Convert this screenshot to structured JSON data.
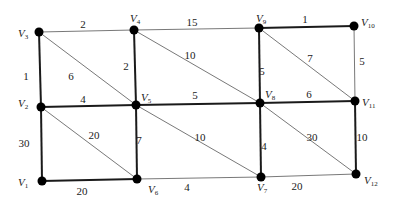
{
  "graph": {
    "nodes": [
      {
        "id": "V1",
        "label": "V",
        "sub": "1",
        "x": 42,
        "y": 181,
        "lx": 18,
        "ly": 186
      },
      {
        "id": "V2",
        "label": "V",
        "sub": "2",
        "x": 41,
        "y": 107,
        "lx": 18,
        "ly": 107
      },
      {
        "id": "V3",
        "label": "V",
        "sub": "3",
        "x": 39,
        "y": 32,
        "lx": 18,
        "ly": 37
      },
      {
        "id": "V4",
        "label": "V",
        "sub": "4",
        "x": 134,
        "y": 30,
        "lx": 130,
        "ly": 22
      },
      {
        "id": "V5",
        "label": "V",
        "sub": "5",
        "x": 136,
        "y": 105,
        "lx": 141,
        "ly": 101
      },
      {
        "id": "V6",
        "label": "V",
        "sub": "6",
        "x": 137,
        "y": 179,
        "lx": 148,
        "ly": 193
      },
      {
        "id": "V7",
        "label": "V",
        "sub": "7",
        "x": 261,
        "y": 177,
        "lx": 257,
        "ly": 191
      },
      {
        "id": "V8",
        "label": "V",
        "sub": "8",
        "x": 260,
        "y": 103,
        "lx": 265,
        "ly": 98
      },
      {
        "id": "V9",
        "label": "V",
        "sub": "9",
        "x": 259,
        "y": 28,
        "lx": 256,
        "ly": 22
      },
      {
        "id": "V10",
        "label": "V",
        "sub": "10",
        "x": 354,
        "y": 26,
        "lx": 361,
        "ly": 26
      },
      {
        "id": "V11",
        "label": "V",
        "sub": "11",
        "x": 355,
        "y": 101,
        "lx": 362,
        "ly": 106
      },
      {
        "id": "V12",
        "label": "V",
        "sub": "12",
        "x": 356,
        "y": 174,
        "lx": 364,
        "ly": 184
      }
    ],
    "edges": [
      {
        "from": "V3",
        "to": "V4",
        "weight": "2",
        "bold": false,
        "lx": 83,
        "ly": 28
      },
      {
        "from": "V4",
        "to": "V9",
        "weight": "15",
        "bold": false,
        "lx": 192,
        "ly": 26
      },
      {
        "from": "V9",
        "to": "V10",
        "weight": "1",
        "bold": true,
        "lx": 305,
        "ly": 23
      },
      {
        "from": "V3",
        "to": "V2",
        "weight": "1",
        "bold": true,
        "lx": 26,
        "ly": 80
      },
      {
        "from": "V3",
        "to": "V5",
        "weight": "6",
        "bold": false,
        "lx": 71,
        "ly": 80
      },
      {
        "from": "V4",
        "to": "V5",
        "weight": "2",
        "bold": true,
        "lx": 126,
        "ly": 70
      },
      {
        "from": "V4",
        "to": "V8",
        "weight": "10",
        "bold": false,
        "lx": 190,
        "ly": 59
      },
      {
        "from": "V9",
        "to": "V8",
        "weight": "5",
        "bold": true,
        "lx": 262,
        "ly": 75
      },
      {
        "from": "V9",
        "to": "V11",
        "weight": "7",
        "bold": false,
        "lx": 310,
        "ly": 62
      },
      {
        "from": "V10",
        "to": "V11",
        "weight": "5",
        "bold": false,
        "lx": 362,
        "ly": 65
      },
      {
        "from": "V2",
        "to": "V5",
        "weight": "4",
        "bold": true,
        "lx": 83,
        "ly": 103
      },
      {
        "from": "V5",
        "to": "V8",
        "weight": "5",
        "bold": true,
        "lx": 195,
        "ly": 99
      },
      {
        "from": "V8",
        "to": "V11",
        "weight": "6",
        "bold": true,
        "lx": 309,
        "ly": 98
      },
      {
        "from": "V2",
        "to": "V1",
        "weight": "30",
        "bold": true,
        "lx": 24,
        "ly": 147
      },
      {
        "from": "V2",
        "to": "V6",
        "weight": "20",
        "bold": false,
        "lx": 94,
        "ly": 139
      },
      {
        "from": "V5",
        "to": "V6",
        "weight": "7",
        "bold": true,
        "lx": 139,
        "ly": 144
      },
      {
        "from": "V5",
        "to": "V7",
        "weight": "10",
        "bold": false,
        "lx": 200,
        "ly": 141
      },
      {
        "from": "V8",
        "to": "V7",
        "weight": "4",
        "bold": true,
        "lx": 264,
        "ly": 150
      },
      {
        "from": "V8",
        "to": "V12",
        "weight": "30",
        "bold": false,
        "lx": 312,
        "ly": 141
      },
      {
        "from": "V11",
        "to": "V12",
        "weight": "10",
        "bold": true,
        "lx": 362,
        "ly": 141
      },
      {
        "from": "V1",
        "to": "V6",
        "weight": "20",
        "bold": true,
        "lx": 82,
        "ly": 195
      },
      {
        "from": "V6",
        "to": "V7",
        "weight": "4",
        "bold": false,
        "lx": 187,
        "ly": 191
      },
      {
        "from": "V7",
        "to": "V12",
        "weight": "20",
        "bold": false,
        "lx": 297,
        "ly": 190
      }
    ]
  }
}
